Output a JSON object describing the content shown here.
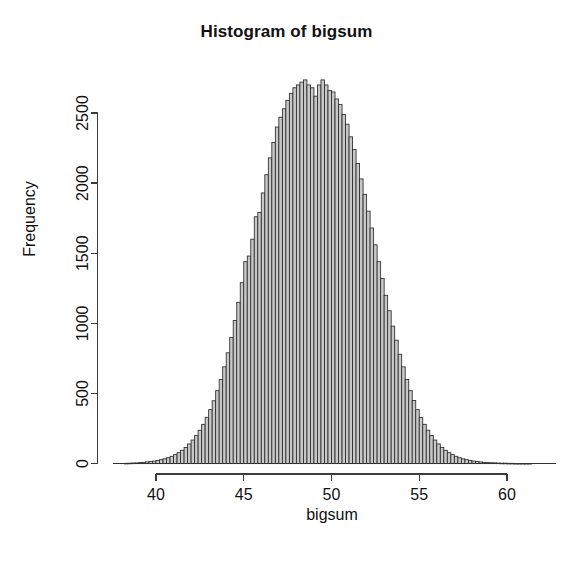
{
  "chart_data": {
    "type": "bar",
    "title": "Histogram of bigsum",
    "xlabel": "bigsum",
    "ylabel": "Frequency",
    "grid": false,
    "legend": null,
    "xlim": [
      38.2,
      61.5
    ],
    "ylim": [
      0,
      2750
    ],
    "xticks": [
      40,
      45,
      50,
      55,
      60
    ],
    "yticks": [
      0,
      500,
      1000,
      1500,
      2000,
      2500
    ],
    "xtick_labels": [
      "40",
      "45",
      "50",
      "55",
      "60"
    ],
    "ytick_labels": [
      "0",
      "500",
      "1000",
      "1500",
      "2000",
      "2500"
    ],
    "bin_width": 0.2,
    "bin_starts": [
      38.2,
      38.4,
      38.6,
      38.8,
      39.0,
      39.2,
      39.4,
      39.6,
      39.8,
      40.0,
      40.2,
      40.4,
      40.6,
      40.8,
      41.0,
      41.2,
      41.4,
      41.6,
      41.8,
      42.0,
      42.2,
      42.4,
      42.6,
      42.8,
      43.0,
      43.2,
      43.4,
      43.6,
      43.8,
      44.0,
      44.2,
      44.4,
      44.6,
      44.8,
      45.0,
      45.2,
      45.4,
      45.6,
      45.8,
      46.0,
      46.2,
      46.4,
      46.6,
      46.8,
      47.0,
      47.2,
      47.4,
      47.6,
      47.8,
      48.0,
      48.2,
      48.4,
      48.6,
      48.8,
      49.0,
      49.2,
      49.4,
      49.6,
      49.8,
      50.0,
      50.2,
      50.4,
      50.6,
      50.8,
      51.0,
      51.2,
      51.4,
      51.6,
      51.8,
      52.0,
      52.2,
      52.4,
      52.6,
      52.8,
      53.0,
      53.2,
      53.4,
      53.6,
      53.8,
      54.0,
      54.2,
      54.4,
      54.6,
      54.8,
      55.0,
      55.2,
      55.4,
      55.6,
      55.8,
      56.0,
      56.2,
      56.4,
      56.6,
      56.8,
      57.0,
      57.2,
      57.4,
      57.6,
      57.8,
      58.0,
      58.2,
      58.4,
      58.6,
      58.8,
      59.0,
      59.2,
      59.4,
      59.6,
      59.8,
      60.0,
      60.2,
      60.4,
      60.6,
      60.8,
      61.0,
      61.2
    ],
    "counts": [
      2,
      3,
      4,
      5,
      7,
      9,
      12,
      15,
      18,
      22,
      28,
      34,
      42,
      52,
      64,
      78,
      95,
      115,
      140,
      168,
      200,
      238,
      280,
      330,
      385,
      448,
      520,
      600,
      690,
      790,
      900,
      1020,
      1150,
      1290,
      1440,
      1480,
      1600,
      1760,
      1790,
      1930,
      2060,
      2180,
      2290,
      2400,
      2470,
      2530,
      2590,
      2640,
      2680,
      2700,
      2720,
      2736,
      2700,
      2680,
      2620,
      2700,
      2736,
      2700,
      2660,
      2650,
      2600,
      2560,
      2490,
      2420,
      2330,
      2240,
      2140,
      2030,
      1920,
      1800,
      1680,
      1560,
      1440,
      1320,
      1200,
      1090,
      980,
      880,
      780,
      690,
      600,
      520,
      450,
      385,
      330,
      280,
      238,
      200,
      168,
      140,
      115,
      95,
      78,
      64,
      52,
      42,
      34,
      28,
      22,
      18,
      15,
      12,
      9,
      7,
      6,
      5,
      4,
      3,
      3,
      2,
      2,
      1,
      1,
      1,
      1,
      1,
      1,
      0
    ],
    "peak_count": 2736,
    "peak_center": 50.1,
    "distribution": "approximately normal",
    "center": 50,
    "spread_note": "bell-shaped, tails from about 38 to 61"
  },
  "axes": {
    "title_text": "Histogram of bigsum",
    "x_axis_label": "bigsum",
    "y_axis_label": "Frequency"
  }
}
